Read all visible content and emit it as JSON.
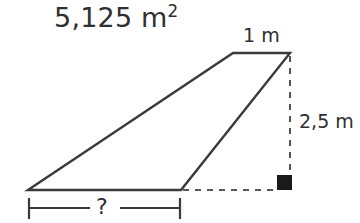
{
  "figure": {
    "kind": "geometry-diagram",
    "shape": "quadrilateral-with-height",
    "background_color": "#ffffff",
    "stroke_color": "#3a3a3a",
    "dashed_color": "#555555",
    "text_color": "#2f2f2f",
    "labels": {
      "area_value": "5,125",
      "area_unit": "m",
      "area_exponent": "2",
      "top_edge": "1 m",
      "height": "2,5 m",
      "unknown_base": "?"
    },
    "markers": {
      "right_angle": "filled-square"
    },
    "geometry": {
      "vertices": {
        "bottom_left": [
          28,
          190
        ],
        "top_left": [
          233,
          53
        ],
        "top_right": [
          290,
          53
        ],
        "bottom_right": [
          181,
          190
        ]
      },
      "dashed_vertical": [
        [
          290,
          55
        ],
        [
          290,
          188
        ]
      ],
      "dashed_horizontal": [
        [
          183,
          190
        ],
        [
          278,
          190
        ]
      ],
      "dimension_line": {
        "y": 208,
        "x_start": 28,
        "x_end": 181
      }
    }
  }
}
